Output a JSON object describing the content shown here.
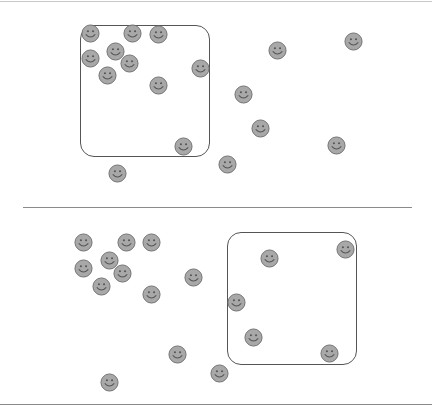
{
  "colors": {
    "face_fill": "#a8a8a8",
    "face_stroke": "#6e6e6e",
    "face_feature": "#555555",
    "box_stroke": "#555555",
    "line_color": "#8a8a8a",
    "top_line_color": "#c8c8c8"
  },
  "lines": [
    {
      "name": "top-border-line",
      "x1": 0,
      "x2": 432,
      "y": 1,
      "color": "#c8c8c8"
    },
    {
      "name": "middle-divider-line",
      "x1": 23,
      "x2": 412,
      "y": 207,
      "color": "#8a8a8a"
    },
    {
      "name": "bottom-border-line",
      "x1": 0,
      "x2": 432,
      "y": 404,
      "color": "#8a8a8a"
    }
  ],
  "panels": [
    {
      "name": "top-panel",
      "box": {
        "x": 80,
        "y": 25,
        "width": 130,
        "height": 132
      },
      "faces": [
        {
          "x": 90,
          "y": 33
        },
        {
          "x": 132,
          "y": 33
        },
        {
          "x": 158,
          "y": 34
        },
        {
          "x": 115,
          "y": 51
        },
        {
          "x": 90,
          "y": 58
        },
        {
          "x": 129,
          "y": 63
        },
        {
          "x": 107,
          "y": 75
        },
        {
          "x": 158,
          "y": 85
        },
        {
          "x": 200,
          "y": 68
        },
        {
          "x": 183,
          "y": 146
        },
        {
          "x": 117,
          "y": 173
        },
        {
          "x": 227,
          "y": 164
        },
        {
          "x": 243,
          "y": 94
        },
        {
          "x": 277,
          "y": 50
        },
        {
          "x": 353,
          "y": 41
        },
        {
          "x": 260,
          "y": 128
        },
        {
          "x": 336,
          "y": 145
        }
      ]
    },
    {
      "name": "bottom-panel",
      "box": {
        "x": 227,
        "y": 232,
        "width": 130,
        "height": 133
      },
      "faces": [
        {
          "x": 83,
          "y": 242
        },
        {
          "x": 126,
          "y": 242
        },
        {
          "x": 151,
          "y": 242
        },
        {
          "x": 109,
          "y": 260
        },
        {
          "x": 83,
          "y": 268
        },
        {
          "x": 122,
          "y": 273
        },
        {
          "x": 101,
          "y": 286
        },
        {
          "x": 151,
          "y": 294
        },
        {
          "x": 193,
          "y": 277
        },
        {
          "x": 269,
          "y": 258
        },
        {
          "x": 345,
          "y": 249
        },
        {
          "x": 236,
          "y": 302
        },
        {
          "x": 253,
          "y": 337
        },
        {
          "x": 329,
          "y": 353
        },
        {
          "x": 177,
          "y": 354
        },
        {
          "x": 219,
          "y": 373
        },
        {
          "x": 109,
          "y": 382
        }
      ]
    }
  ]
}
